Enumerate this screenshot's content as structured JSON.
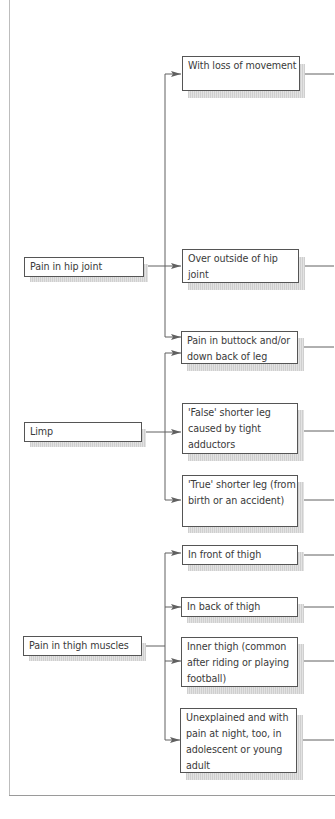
{
  "diagram": {
    "type": "flowchart",
    "colors": {
      "line": "#606060",
      "box_border": "#555555",
      "shadow": "#d6d6d6",
      "text": "#3a3a3a"
    },
    "sources": [
      {
        "id": "hip",
        "label": "Pain in hip joint"
      },
      {
        "id": "limp",
        "label": "Limp"
      },
      {
        "id": "thigh",
        "label": "Pain in thigh muscles"
      }
    ],
    "targets": [
      {
        "id": "t1",
        "label": "With loss of movement",
        "from": [
          "hip"
        ]
      },
      {
        "id": "t2",
        "label": "Over outside of hip joint",
        "from": [
          "hip"
        ]
      },
      {
        "id": "t3",
        "label": "Pain in buttock and/or down back of leg",
        "from": [
          "hip",
          "limp"
        ]
      },
      {
        "id": "t4",
        "label": "'False' shorter leg caused by tight adductors",
        "from": [
          "limp"
        ]
      },
      {
        "id": "t5",
        "label": "'True' shorter leg (from birth or an accident)",
        "from": [
          "limp"
        ]
      },
      {
        "id": "t6",
        "label": "In front of thigh",
        "from": [
          "thigh"
        ]
      },
      {
        "id": "t7",
        "label": "In back of thigh",
        "from": [
          "thigh"
        ]
      },
      {
        "id": "t8",
        "label": "Inner thigh (common after riding or playing football)",
        "from": [
          "thigh"
        ]
      },
      {
        "id": "t9",
        "label": "Unexplained and with pain at night, too, in adolescent or young adult",
        "from": [
          "thigh"
        ]
      }
    ]
  }
}
